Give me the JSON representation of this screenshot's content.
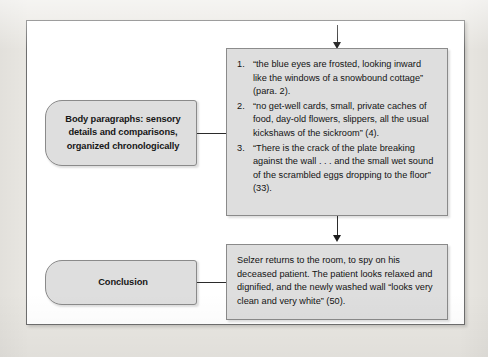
{
  "figure": {
    "nodes": {
      "body_paragraphs_label": {
        "lines": [
          "Body paragraphs: sensory",
          "details and comparisons,",
          "organized chronologically"
        ]
      },
      "conclusion_label": {
        "text": "Conclusion"
      },
      "evidence_box": {
        "items": [
          "“the blue eyes are frosted, looking inward like the windows of a snowbound cottage” (para. 2).",
          "“no get-well cards, small, private caches of food, day-old flowers, slippers, all the usual kickshaws of the sickroom” (4).",
          "“There is the crack of the plate breaking against the wall . . . and the small wet sound of the scrambled eggs dropping to the floor” (33)."
        ]
      },
      "conclusion_box": {
        "text": "Selzer returns to the room, to spy on his deceased patient. The patient looks relaxed and dignified, and the newly washed wall “looks very clean and very white” (50)."
      }
    },
    "colors": {
      "page_background": "#e9e7e2",
      "frame_background": "#ffffff",
      "box_fill": "#dedede",
      "box_border": "#8a8a8a",
      "connector": "#2b2b2b",
      "text": "#131313"
    }
  }
}
